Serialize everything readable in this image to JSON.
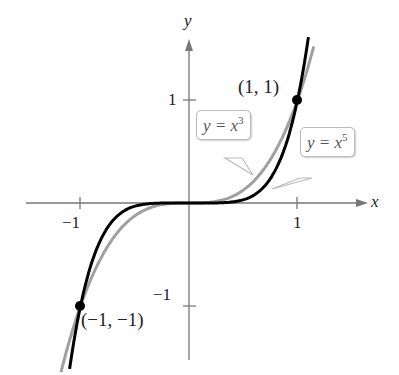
{
  "chart_data": {
    "type": "line",
    "title": "",
    "xlabel": "x",
    "ylabel": "y",
    "xlim": [
      -1.5,
      1.6
    ],
    "ylim": [
      -1.5,
      1.6
    ],
    "grid": false,
    "x_ticks": [
      "-1",
      "1"
    ],
    "y_ticks": [
      "1",
      "-1"
    ],
    "series": [
      {
        "name": "y = x^3",
        "color": "#999999",
        "function": "x^3",
        "x": [
          -1.2,
          -1,
          -0.5,
          0,
          0.5,
          1,
          1.15
        ],
        "y": [
          -1.728,
          -1,
          -0.125,
          0,
          0.125,
          1,
          1.521
        ]
      },
      {
        "name": "y = x^5",
        "color": "#000000",
        "function": "x^5",
        "x": [
          -1.1,
          -1,
          -0.5,
          0,
          0.5,
          1,
          1.1
        ],
        "y": [
          -1.611,
          -1,
          -0.031,
          0,
          0.031,
          1,
          1.611
        ]
      }
    ],
    "points": [
      {
        "label": "(1, 1)",
        "x": 1,
        "y": 1
      },
      {
        "label": "(−1, −1)",
        "x": -1,
        "y": -1
      }
    ],
    "annotations": [
      "y = x3",
      "y = x5"
    ]
  },
  "labels": {
    "x_axis": "x",
    "y_axis": "y",
    "tick_x_neg1": "−1",
    "tick_x_1": "1",
    "tick_y_1": "1",
    "tick_y_neg1": "−1",
    "point_pos": "(1, 1)",
    "point_neg": "(−1, −1)",
    "callout_cube_base": "y = x",
    "callout_cube_exp": "3",
    "callout_fifth_base": "y = x",
    "callout_fifth_exp": "5"
  }
}
